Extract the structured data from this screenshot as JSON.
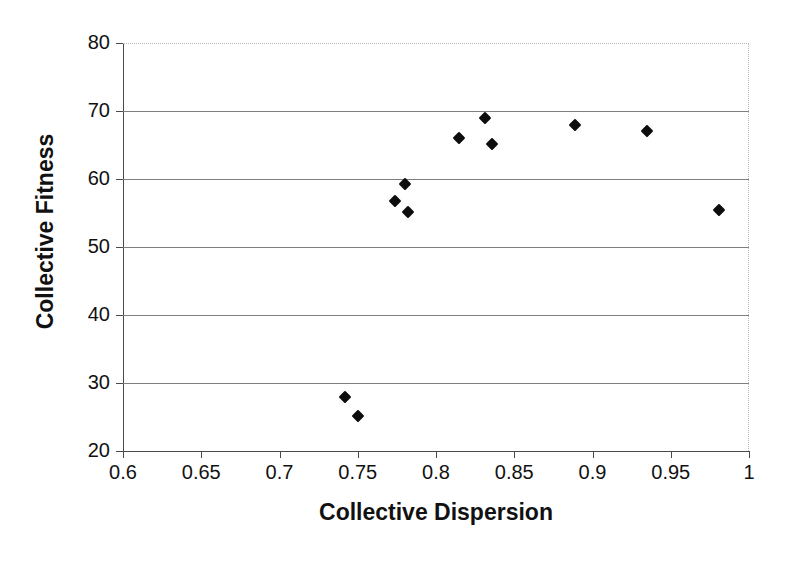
{
  "chart_data": {
    "type": "scatter",
    "title": "",
    "xlabel": "Collective Dispersion",
    "ylabel": "Collective Fitness",
    "xlim": [
      0.6,
      1.0
    ],
    "ylim": [
      20,
      80
    ],
    "xticks": [
      "0.6",
      "0.65",
      "0.7",
      "0.75",
      "0.8",
      "0.85",
      "0.9",
      "0.95",
      "1"
    ],
    "xtick_values": [
      0.6,
      0.65,
      0.7,
      0.75,
      0.8,
      0.85,
      0.9,
      0.95,
      1.0
    ],
    "yticks": [
      "20",
      "30",
      "40",
      "50",
      "60",
      "70",
      "80"
    ],
    "ytick_values": [
      20,
      30,
      40,
      50,
      60,
      70,
      80
    ],
    "grid": "horizontal",
    "legend": "none",
    "marker_shape": "diamond",
    "marker_color": "#0d0d0d",
    "series": [
      {
        "name": "Collective Fitness vs Collective Dispersion",
        "points": [
          {
            "x": 0.742,
            "y": 28.0
          },
          {
            "x": 0.75,
            "y": 25.1
          },
          {
            "x": 0.774,
            "y": 56.7
          },
          {
            "x": 0.78,
            "y": 59.3
          },
          {
            "x": 0.782,
            "y": 55.1
          },
          {
            "x": 0.815,
            "y": 66.1
          },
          {
            "x": 0.831,
            "y": 68.9
          },
          {
            "x": 0.836,
            "y": 65.1
          },
          {
            "x": 0.889,
            "y": 68.0
          },
          {
            "x": 0.935,
            "y": 67.0
          },
          {
            "x": 0.981,
            "y": 55.4
          }
        ]
      }
    ]
  },
  "colors": {
    "marker": "#0d0d0d",
    "gridline": "#7f7f7f",
    "axis": "#4a4a4a",
    "border_dotted": "#b8b8b8",
    "background": "#ffffff",
    "text": "#111111"
  }
}
